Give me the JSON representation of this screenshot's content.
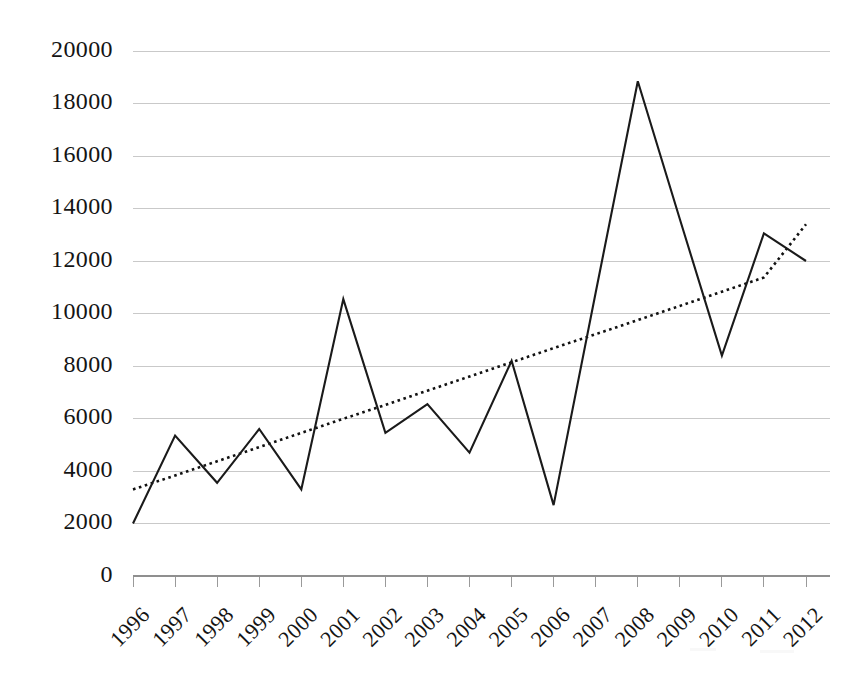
{
  "chart_data": {
    "type": "line",
    "title": "",
    "subtitle": "",
    "xlabel": "",
    "ylabel": "",
    "categories": [
      "1996",
      "1997",
      "1998",
      "1999",
      "2000",
      "2001",
      "2002",
      "2003",
      "2004",
      "2005",
      "2006",
      "2007",
      "2008",
      "2009",
      "2010",
      "2011",
      "2012"
    ],
    "series": [
      {
        "name": "Data",
        "style": "solid",
        "color": "#1a1a1a",
        "values": [
          2000,
          5350,
          3550,
          5600,
          3300,
          10550,
          5450,
          6550,
          4700,
          8200,
          2700,
          10800,
          18850,
          13600,
          8400,
          13050,
          12000
        ]
      },
      {
        "name": "Trendline",
        "style": "dotted",
        "color": "#111111",
        "values": [
          3300,
          3830,
          4370,
          4910,
          5450,
          5990,
          6520,
          7060,
          7600,
          8140,
          8680,
          9210,
          9750,
          10290,
          10830,
          11370,
          13400
        ]
      }
    ],
    "trendline": {
      "start_value": 3300,
      "end_value": 13400,
      "start_category": "1996",
      "end_category": "2012",
      "style": "dotted"
    },
    "ylim": [
      0,
      20000
    ],
    "ytick_step": 2000,
    "yticks": [
      "0",
      "2000",
      "4000",
      "6000",
      "8000",
      "10000",
      "12000",
      "14000",
      "16000",
      "18000",
      "20000"
    ],
    "xticks": [
      "1996",
      "1997",
      "1998",
      "1999",
      "2000",
      "2001",
      "2002",
      "2003",
      "2004",
      "2005",
      "2006",
      "2007",
      "2008",
      "2009",
      "2010",
      "2011",
      "2012"
    ],
    "grid": {
      "horizontal": true,
      "vertical": false,
      "color": "#c9c9c9"
    },
    "legend": {
      "visible": false,
      "position": "none",
      "entries": []
    },
    "xlabel_rotation": -45,
    "axis_color": "#8f8f8f",
    "background": "#ffffff"
  },
  "figure": {
    "alt": "Line chart of annual values from 1996 to 2012 with a dotted rising trendline"
  }
}
